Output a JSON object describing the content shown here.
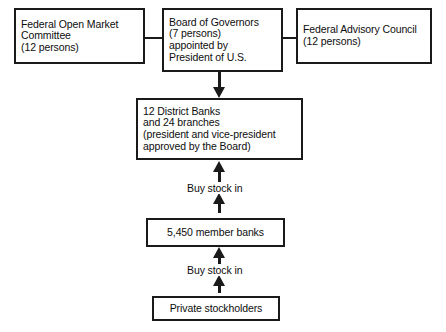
{
  "diagram": {
    "background_color": "#ffffff",
    "line_color": "#1a1a1a",
    "text_color": "#0d0d0d",
    "nodes": {
      "fomc": {
        "text": "Federal Open Market\nCommittee\n(12 persons)",
        "align": "left"
      },
      "governors": {
        "text": "Board of Governors\n(7 persons)\nappointed by\nPresident of U.S.",
        "align": "left"
      },
      "advisory": {
        "text": "Federal Advisory Council\n(12 persons)",
        "align": "left"
      },
      "district_banks": {
        "text": "12 District Banks\nand 24 branches\n(president and vice-president\napproved by the Board)",
        "align": "left"
      },
      "member_banks": {
        "text": "5,450 member banks",
        "align": "center"
      },
      "private_stockholders": {
        "text": "Private stockholders",
        "align": "center"
      }
    },
    "edges": {
      "fomc_to_governors": {
        "label": "",
        "style": "line",
        "direction": "none"
      },
      "governors_to_advisory": {
        "label": "",
        "style": "line",
        "direction": "none"
      },
      "governors_to_district": {
        "label": "",
        "style": "arrow",
        "direction": "down"
      },
      "member_to_district": {
        "label": "Buy stock in",
        "style": "arrow",
        "direction": "up"
      },
      "private_to_member": {
        "label": "Buy stock in",
        "style": "arrow",
        "direction": "up"
      }
    }
  }
}
